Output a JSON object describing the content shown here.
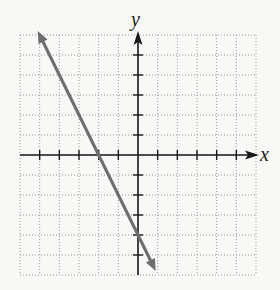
{
  "graph": {
    "x_axis_label": "x",
    "y_axis_label": "y",
    "grid": {
      "x_min": -6,
      "x_max": 6,
      "y_min": -6,
      "y_max": 6,
      "step": 1,
      "style": "dotted"
    },
    "colors": {
      "background": "#f8f8f6",
      "grid": "#9a9a9a",
      "axes": "#1a1a1a",
      "line": "#6e6e6e"
    }
  },
  "chart_data": {
    "type": "line",
    "title": "",
    "xlabel": "x",
    "ylabel": "y",
    "xlim": [
      -6,
      6
    ],
    "ylim": [
      -6,
      6
    ],
    "grid": true,
    "equation": "y = -2x - 4",
    "series": [
      {
        "name": "line",
        "x": [
          -5.1,
          -2,
          0,
          0.9
        ],
        "y": [
          6.2,
          0,
          -4,
          -5.8
        ],
        "arrows_both_ends": true
      }
    ],
    "x_intercept": -2,
    "y_intercept": -4,
    "slope": -2
  }
}
